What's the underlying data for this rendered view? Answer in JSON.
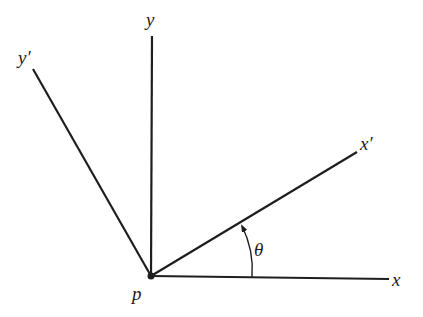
{
  "diagram": {
    "colors": {
      "line": "#1e1e1e",
      "background": "#ffffff"
    },
    "origin": {
      "label": "p",
      "x": 151,
      "y": 276
    },
    "axes": [
      {
        "id": "x",
        "label": "x",
        "end": [
          389,
          279
        ]
      },
      {
        "id": "y",
        "label": "y",
        "end": [
          152,
          36
        ]
      },
      {
        "id": "x_prime",
        "label": "x′",
        "end": [
          357,
          152
        ]
      },
      {
        "id": "y_prime",
        "label": "y′",
        "end": [
          33,
          69
        ]
      }
    ],
    "angle": {
      "label": "θ",
      "from": "x",
      "to": "x_prime",
      "arrow": true
    }
  }
}
